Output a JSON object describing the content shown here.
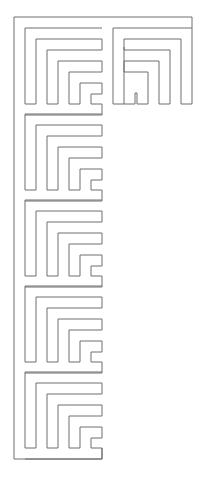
{
  "diagram": {
    "type": "maze-outline",
    "stroke_color": "#6e6e6e",
    "background": "#ffffff",
    "width": 204,
    "height": 480,
    "outer_frame": {
      "left_x": 14,
      "top_y": 17,
      "right_x": 192,
      "bottom_y": 459,
      "column_right_x": 102
    },
    "left_blocks": [
      {
        "top": 28
      },
      {
        "top": 114
      },
      {
        "top": 200
      },
      {
        "top": 286
      },
      {
        "top": 372
      }
    ],
    "left_block_spec": {
      "stems_x": [
        25,
        36,
        47,
        58,
        69,
        80
      ],
      "step": 11,
      "height": 76,
      "right_x": 102
    },
    "right_block": {
      "left_x": 113,
      "top_y": 28,
      "right_x": 192,
      "bottom_y": 104,
      "step": 11
    }
  }
}
